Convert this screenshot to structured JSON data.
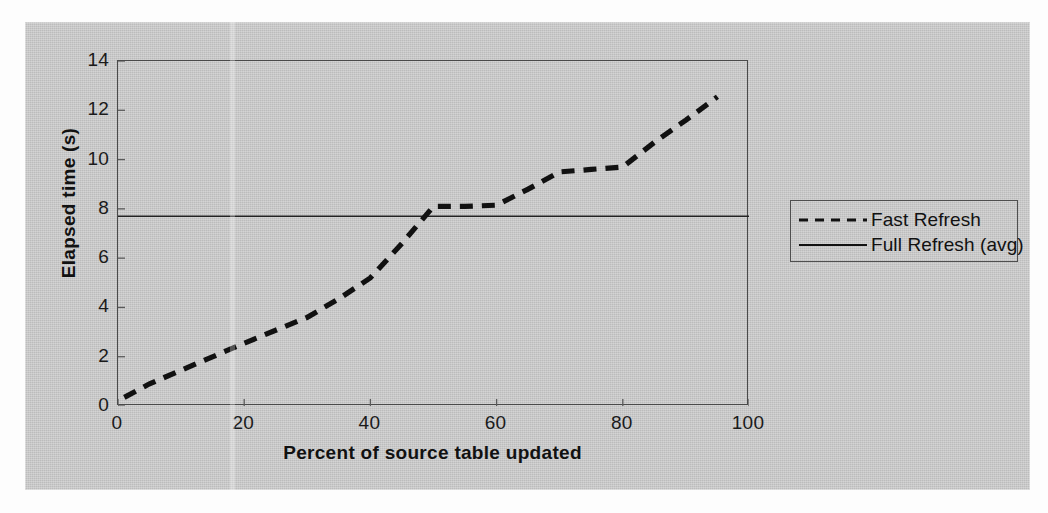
{
  "chart_data": {
    "type": "line",
    "title": "",
    "xlabel": "Percent of source table updated",
    "ylabel": "Elapsed time (s)",
    "xlim": [
      0,
      100
    ],
    "ylim": [
      0,
      14
    ],
    "xticks": [
      "0",
      "20",
      "40",
      "60",
      "80",
      "100"
    ],
    "yticks": [
      "0",
      "2",
      "4",
      "6",
      "8",
      "10",
      "12",
      "14"
    ],
    "grid": false,
    "legend_position": "right-outside",
    "series": [
      {
        "name": "Fast Refresh",
        "style": "dashed",
        "color": "#111111",
        "x": [
          1,
          5,
          10,
          20,
          30,
          35,
          40,
          45,
          50,
          55,
          60,
          65,
          70,
          75,
          80,
          85,
          90,
          95
        ],
        "values": [
          0.35,
          0.9,
          1.45,
          2.55,
          3.6,
          4.35,
          5.2,
          6.6,
          8.1,
          8.1,
          8.15,
          8.8,
          9.5,
          9.6,
          9.7,
          10.7,
          11.6,
          12.55
        ]
      },
      {
        "name": "Full Refresh (avg)",
        "style": "solid",
        "color": "#111111",
        "constant_value": 7.7,
        "x": [
          0,
          100
        ],
        "values": [
          7.7,
          7.7
        ]
      }
    ]
  },
  "axes": {
    "y_title": "Elapsed time (s)",
    "x_title": "Percent of source table updated",
    "y_tick_labels": [
      "14",
      "12",
      "10",
      "8",
      "6",
      "4",
      "2",
      "0"
    ],
    "x_tick_labels": [
      "0",
      "20",
      "40",
      "60",
      "80",
      "100"
    ]
  },
  "legend": {
    "items": [
      {
        "label": "Fast Refresh",
        "style": "dashed"
      },
      {
        "label": "Full Refresh (avg)",
        "style": "solid"
      }
    ]
  },
  "colors": {
    "panel_background": "#c9c9c9",
    "page_background": "#fdfdfd",
    "axis": "#4a4a4a",
    "series": "#111111"
  }
}
